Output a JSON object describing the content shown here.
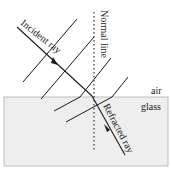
{
  "diagram": {
    "labels": {
      "incident_ray": "Incident ray",
      "normal_line": "Normal line",
      "refracted_ray": "Refracted ray",
      "air": "air",
      "glass": "glass"
    },
    "colors": {
      "glass_fill": "#eeeeee",
      "glass_border": "#bdbdbd",
      "line": "#1a1a1a",
      "background": "#ffffff"
    },
    "media": [
      "air",
      "glass"
    ]
  }
}
